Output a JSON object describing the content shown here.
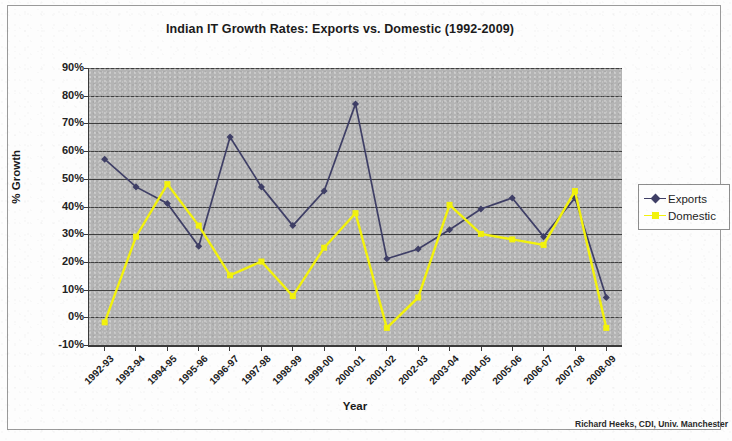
{
  "chart_data": {
    "type": "line",
    "title": "Indian IT Growth Rates: Exports vs. Domestic (1992-2009)",
    "xlabel": "Year",
    "ylabel": "% Growth",
    "categories": [
      "1992-93",
      "1993-94",
      "1994-95",
      "1995-96",
      "1996-97",
      "1997-98",
      "1998-99",
      "1999-00",
      "2000-01",
      "2001-02",
      "2002-03",
      "2003-04",
      "2004-05",
      "2005-06",
      "2006-07",
      "2007-08",
      "2008-09"
    ],
    "series": [
      {
        "name": "Exports",
        "color": "#3f3f66",
        "marker": "diamond",
        "values": [
          57,
          47,
          41,
          25.5,
          65,
          47,
          33,
          45.5,
          77,
          21,
          24.5,
          31.5,
          39,
          43,
          29,
          43,
          7
        ]
      },
      {
        "name": "Domestic",
        "color": "#f2f20c",
        "marker": "square",
        "values": [
          -2,
          29,
          48,
          33,
          15,
          20,
          7.5,
          25,
          37.5,
          -4,
          7,
          40.5,
          30,
          28,
          26,
          45.5,
          -4
        ]
      }
    ],
    "ylim": [
      -10,
      90
    ],
    "ytick_labels": [
      "90%",
      "80%",
      "70%",
      "60%",
      "50%",
      "40%",
      "30%",
      "20%",
      "10%",
      "0%",
      "-10%"
    ],
    "ytick_values": [
      90,
      80,
      70,
      60,
      50,
      40,
      30,
      20,
      10,
      0,
      -10
    ],
    "grid": true,
    "legend_position": "right",
    "plot_background": "#b4b4b4"
  },
  "legend": {
    "entries": [
      {
        "label": "Exports"
      },
      {
        "label": "Domestic"
      }
    ]
  },
  "credit": {
    "text": "Richard Heeks, CDI, Univ. Manchester"
  }
}
